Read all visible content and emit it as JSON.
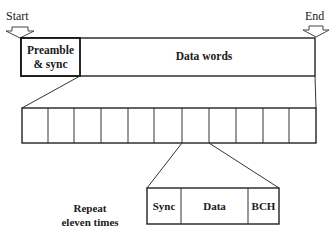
{
  "diagram": {
    "type": "frame-structure",
    "markers": {
      "start": "Start",
      "end": "End"
    },
    "top_frame": {
      "fields": [
        {
          "label_line1": "Preamble",
          "label_line2": "& sync"
        },
        {
          "label": "Data words"
        }
      ]
    },
    "word_row": {
      "cell_count": 11
    },
    "repeat_note": {
      "line1": "Repeat",
      "line2": "eleven times"
    },
    "word_detail": {
      "fields": [
        {
          "label": "Sync"
        },
        {
          "label": "Data"
        },
        {
          "label": "BCH"
        }
      ]
    },
    "colors": {
      "stroke": "#222222",
      "text": "#1a1a1a",
      "background": "#ffffff"
    }
  }
}
